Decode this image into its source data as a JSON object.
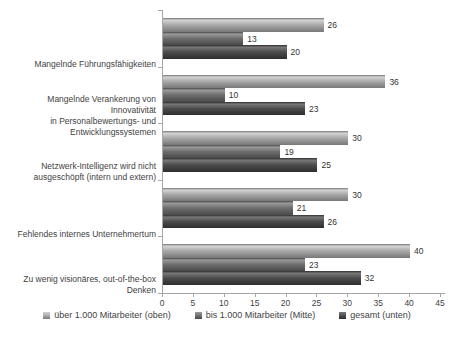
{
  "chart_data": {
    "type": "bar",
    "orientation": "horizontal",
    "title": "",
    "xlabel": "",
    "ylabel": "",
    "xlim": [
      0,
      45
    ],
    "xticks": [
      0,
      5,
      10,
      15,
      20,
      25,
      30,
      35,
      40,
      45
    ],
    "grid": false,
    "value_labels": true,
    "legend_position": "bottom",
    "categories": [
      "Mangelnde Führungsfähigkeiten",
      "Mangelnde Verankerung von Innovativität in Personalbewertungs- und Entwicklungssystemen",
      "Netzwerk-Intelligenz wird nicht ausgeschöpft (intern und extern)",
      "Fehlendes internes Unternehmertum",
      "Zu wenig visionäres, out-of-the-box Denken"
    ],
    "category_label_lines": [
      [
        "Mangelnde Führungsfähigkeiten"
      ],
      [
        "Mangelnde Verankerung von Innovativität",
        "in Personalbewertungs- und",
        "Entwicklungssystemen"
      ],
      [
        "Netzwerk-Intelligenz wird nicht",
        "ausgeschöpft (intern und extern)"
      ],
      [
        "Fehlendes internes Unternehmertum"
      ],
      [
        "Zu wenig visionäres, out-of-the-box",
        "Denken"
      ]
    ],
    "series": [
      {
        "name": "über 1.000 Mitarbeiter (oben)",
        "values": [
          26,
          36,
          30,
          30,
          40
        ],
        "color_base": "#a8a8a8",
        "color_light": "#d4d4d4",
        "color_dark": "#787878"
      },
      {
        "name": "bis 1.000 Mitarbeiter (Mitte)",
        "values": [
          13,
          10,
          19,
          21,
          23
        ],
        "color_base": "#6e6e6e",
        "color_light": "#9a9a9a",
        "color_dark": "#4a4a4a"
      },
      {
        "name": "gesamt (unten)",
        "values": [
          20,
          23,
          25,
          26,
          32
        ],
        "color_base": "#4c4c4c",
        "color_light": "#787878",
        "color_dark": "#2e2e2e"
      }
    ],
    "axis_color": "#a6a6a6",
    "text_color": "#3f3f3f"
  }
}
